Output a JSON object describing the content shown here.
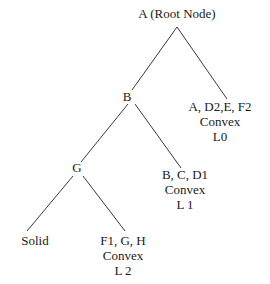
{
  "diagram": {
    "type": "tree",
    "root": {
      "label": "A (Root Node)"
    },
    "nodes": {
      "b": {
        "label": "B"
      },
      "g": {
        "label": "G"
      },
      "leaf_l0": {
        "lines": [
          "A, D2,E, F2",
          "Convex",
          "L0"
        ]
      },
      "leaf_l1": {
        "lines": [
          "B, C, D1",
          "Convex",
          "L 1"
        ]
      },
      "leaf_solid": {
        "label": "Solid"
      },
      "leaf_l2": {
        "lines": [
          "F1, G, H",
          "Convex",
          "L 2"
        ]
      }
    },
    "edges": [
      [
        "A (Root Node)",
        "B"
      ],
      [
        "A (Root Node)",
        "A, D2,E, F2 Convex L0"
      ],
      [
        "B",
        "G"
      ],
      [
        "B",
        "B, C, D1 Convex L 1"
      ],
      [
        "G",
        "Solid"
      ],
      [
        "G",
        "F1, G, H Convex L 2"
      ]
    ],
    "colors": {
      "line": "#3a3a3a",
      "text": "#1a1a1a",
      "background": "#ffffff"
    }
  }
}
